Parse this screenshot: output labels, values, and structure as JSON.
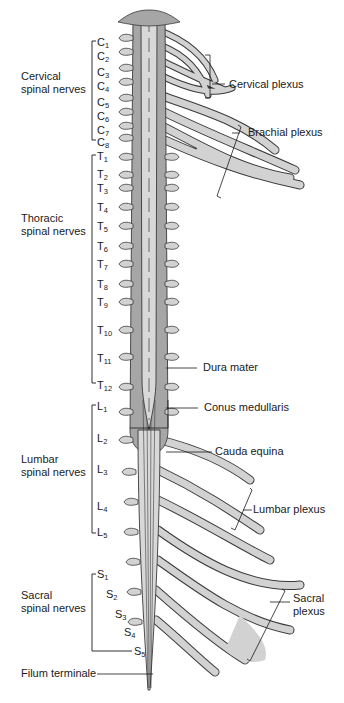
{
  "figure": {
    "colors": {
      "dura": "#a6a6a6",
      "cord": "#d8d8d8",
      "nerve": "#d2d2d2",
      "outline": "#3a3a3a",
      "background": "#ffffff"
    }
  },
  "groups": {
    "cervical": {
      "line1": "Cervical",
      "line2": "spinal nerves"
    },
    "thoracic": {
      "line1": "Thoracic",
      "line2": "spinal nerves"
    },
    "lumbar": {
      "line1": "Lumbar",
      "line2": "spinal nerves"
    },
    "sacral": {
      "line1": "Sacral",
      "line2": "spinal nerves"
    }
  },
  "segments": {
    "cervical": [
      {
        "letter": "C",
        "num": "1"
      },
      {
        "letter": "C",
        "num": "2"
      },
      {
        "letter": "C",
        "num": "3"
      },
      {
        "letter": "C",
        "num": "4"
      },
      {
        "letter": "C",
        "num": "5"
      },
      {
        "letter": "C",
        "num": "6"
      },
      {
        "letter": "C",
        "num": "7"
      },
      {
        "letter": "C",
        "num": "8"
      }
    ],
    "thoracic": [
      {
        "letter": "T",
        "num": "1"
      },
      {
        "letter": "T",
        "num": "2"
      },
      {
        "letter": "T",
        "num": "3"
      },
      {
        "letter": "T",
        "num": "4"
      },
      {
        "letter": "T",
        "num": "5"
      },
      {
        "letter": "T",
        "num": "6"
      },
      {
        "letter": "T",
        "num": "7"
      },
      {
        "letter": "T",
        "num": "8"
      },
      {
        "letter": "T",
        "num": "9"
      },
      {
        "letter": "T",
        "num": "10"
      },
      {
        "letter": "T",
        "num": "11"
      },
      {
        "letter": "T",
        "num": "12"
      }
    ],
    "lumbar": [
      {
        "letter": "L",
        "num": "1"
      },
      {
        "letter": "L",
        "num": "2"
      },
      {
        "letter": "L",
        "num": "3"
      },
      {
        "letter": "L",
        "num": "4"
      },
      {
        "letter": "L",
        "num": "5"
      }
    ],
    "sacral": [
      {
        "letter": "S",
        "num": "1"
      },
      {
        "letter": "S",
        "num": "2"
      },
      {
        "letter": "S",
        "num": "3"
      },
      {
        "letter": "S",
        "num": "4"
      },
      {
        "letter": "S",
        "num": "5"
      }
    ]
  },
  "callouts": {
    "cervical_plexus": "Cervical plexus",
    "brachial_plexus": "Brachial plexus",
    "dura_mater": "Dura mater",
    "conus_medullaris": "Conus medullaris",
    "cauda_equina": "Cauda equina",
    "lumbar_plexus": "Lumbar plexus",
    "sacral_plexus_1": "Sacral",
    "sacral_plexus_2": "plexus",
    "filum_terminale": "Filum terminale"
  }
}
